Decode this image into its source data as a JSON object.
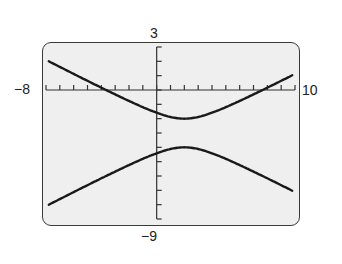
{
  "chart_data": {
    "type": "line",
    "title": "",
    "xlabel": "",
    "ylabel": "",
    "window": {
      "xmin": -8,
      "xmax": 10,
      "ymin": -9,
      "ymax": 3,
      "xscl": 1,
      "yscl": 1
    },
    "tick_labels": {
      "xmin": "−8",
      "xmax": "10",
      "ymax": "3",
      "ymin": "−9"
    },
    "grid": false,
    "legend": null,
    "equation": "(y+3)^2 - (x-2)^2/4 = 1",
    "series": [
      {
        "name": "upper branch",
        "points": [
          [
            -8,
            2.39
          ],
          [
            -6,
            1.12
          ],
          [
            -4,
            -0.16
          ],
          [
            -2,
            -1.16
          ],
          [
            0,
            -1.59
          ],
          [
            1,
            -1.88
          ],
          [
            2,
            -2.0
          ],
          [
            3,
            -1.88
          ],
          [
            4,
            -1.59
          ],
          [
            6,
            -0.76
          ],
          [
            8,
            0.16
          ],
          [
            10,
            1.12
          ]
        ]
      },
      {
        "name": "lower branch",
        "points": [
          [
            -8,
            -8.39
          ],
          [
            -6,
            -7.12
          ],
          [
            -4,
            -6.16
          ],
          [
            -2,
            -4.84
          ],
          [
            0,
            -4.41
          ],
          [
            1,
            -4.12
          ],
          [
            2,
            -4.0
          ],
          [
            3,
            -4.12
          ],
          [
            4,
            -4.41
          ],
          [
            6,
            -5.24
          ],
          [
            8,
            -6.16
          ],
          [
            10,
            -7.12
          ]
        ]
      }
    ],
    "line_color": "#1a1a1a",
    "background_color": "#efefef"
  }
}
